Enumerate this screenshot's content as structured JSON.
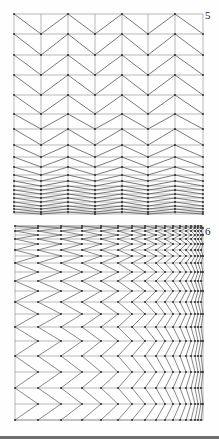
{
  "figures": [
    {
      "label": "5",
      "description": "Chevron grid with rows compressing toward the bottom",
      "orientation": "horizontal-chevrons",
      "bounds": {
        "x0": 14,
        "x1": 203,
        "y0": 14,
        "y1": 214
      },
      "column_x": [
        14,
        41,
        68,
        95,
        122,
        148,
        175,
        203
      ],
      "row_y": [
        14,
        34,
        55,
        75,
        95,
        114,
        129,
        145,
        157,
        167,
        175,
        181,
        186,
        190,
        194,
        198,
        202,
        206,
        209,
        212,
        214
      ],
      "first_vertex_high": true
    },
    {
      "label": "6",
      "description": "Chevron grid with columns compressing toward the right and rows compressing toward the top",
      "orientation": "vertical-chevrons",
      "bounds": {
        "x0": 15,
        "x1": 203,
        "y0": 226,
        "y1": 420
      },
      "column_x": [
        15,
        38,
        61,
        82,
        101,
        118,
        132,
        145,
        156,
        165,
        173,
        180,
        186,
        191,
        195,
        198,
        201,
        203
      ],
      "row_y": [
        226,
        228,
        231,
        235,
        239,
        244,
        250,
        256,
        263,
        272,
        281,
        291,
        302,
        314,
        327,
        341,
        356,
        372,
        388,
        404,
        420
      ],
      "first_vertex_left": true
    }
  ],
  "style": {
    "line_color": "#555555",
    "grid_color": "#8a8a8a",
    "vertex_color": "#222222",
    "bar_color": "#6e6e6e"
  }
}
